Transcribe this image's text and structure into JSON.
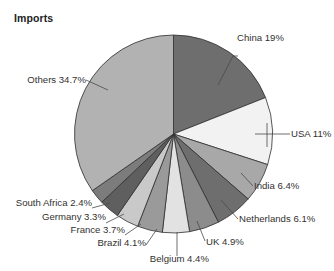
{
  "chart_title": "Imports",
  "chart_data": {
    "type": "pie",
    "title": "Imports",
    "xlabel": "",
    "ylabel": "",
    "legend_position": "none",
    "grid": false,
    "value_unit": "percent",
    "start_angle_deg": 0,
    "direction": "clockwise",
    "categories": [
      "China",
      "USA",
      "India",
      "Netherlands",
      "UK",
      "Belgium",
      "Brazil",
      "France",
      "Germany",
      "South Africa",
      "Others"
    ],
    "values": [
      19,
      11,
      6.4,
      6.1,
      4.9,
      4.4,
      4.1,
      3.7,
      3.3,
      2.4,
      34.7
    ],
    "labels": [
      "China 19%",
      "USA 11%",
      "India 6.4%",
      "Netherlands 6.1%",
      "UK 4.9%",
      "Belgium 4.4%",
      "Brazil 4.1%",
      "France 3.7%",
      "Germany 3.3%",
      "South Africa 2.4%",
      "Others 34.7%"
    ],
    "colors": [
      "#6e6e6e",
      "#f2f2f2",
      "#a8a8a8",
      "#6e6e6e",
      "#8c8c8c",
      "#e2e2e2",
      "#9a9a9a",
      "#c9c9c9",
      "#5f5f5f",
      "#7c7c7c",
      "#b2b2b2"
    ],
    "slices": [
      {
        "name": "China",
        "label": "China 19%",
        "value": 19,
        "color": "#6e6e6e"
      },
      {
        "name": "USA",
        "label": "USA 11%",
        "value": 11,
        "color": "#f2f2f2"
      },
      {
        "name": "India",
        "label": "India 6.4%",
        "value": 6.4,
        "color": "#a8a8a8"
      },
      {
        "name": "Netherlands",
        "label": "Netherlands 6.1%",
        "value": 6.1,
        "color": "#6e6e6e"
      },
      {
        "name": "UK",
        "label": "UK 4.9%",
        "value": 4.9,
        "color": "#8c8c8c"
      },
      {
        "name": "Belgium",
        "label": "Belgium 4.4%",
        "value": 4.4,
        "color": "#e2e2e2"
      },
      {
        "name": "Brazil",
        "label": "Brazil 4.1%",
        "value": 4.1,
        "color": "#9a9a9a"
      },
      {
        "name": "France",
        "label": "France 3.7%",
        "value": 3.7,
        "color": "#c9c9c9"
      },
      {
        "name": "Germany",
        "label": "Germany 3.3%",
        "value": 3.3,
        "color": "#5f5f5f"
      },
      {
        "name": "South Africa",
        "label": "South Africa 2.4%",
        "value": 2.4,
        "color": "#7c7c7c"
      },
      {
        "name": "Others",
        "label": "Others 34.7%",
        "value": 34.7,
        "color": "#b2b2b2"
      }
    ]
  },
  "labels": {
    "china": "China 19%",
    "usa": "USA 11%",
    "india": "India 6.4%",
    "netherlands": "Netherlands 6.1%",
    "uk": "UK 4.9%",
    "belgium": "Belgium 4.4%",
    "brazil": "Brazil 4.1%",
    "france": "France 3.7%",
    "germany": "Germany 3.3%",
    "south_africa": "South Africa 2.4%",
    "others": "Others 34.7%"
  }
}
